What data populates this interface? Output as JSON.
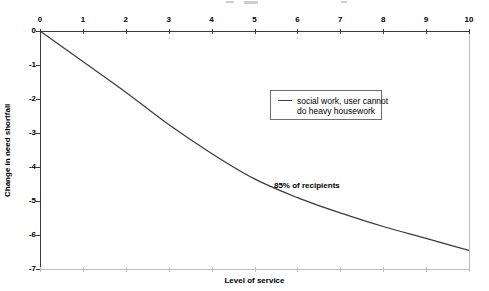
{
  "chart_data": {
    "type": "line",
    "title": "",
    "xlabel": "Level of service",
    "ylabel": "Change in need shortfall",
    "x": [
      0,
      1,
      2,
      3,
      4,
      5,
      6,
      7,
      8,
      9,
      10
    ],
    "x_tick_labels": [
      "0",
      "1",
      "2",
      "3",
      "4",
      "5",
      "6",
      "7",
      "8",
      "9",
      "10"
    ],
    "y_tick_labels": [
      "0",
      "-1",
      "-2",
      "-3",
      "-4",
      "-5",
      "-6",
      "-7"
    ],
    "xlim": [
      0,
      10
    ],
    "ylim": [
      -7,
      0
    ],
    "grid": false,
    "legend_position": "inside-top-right",
    "series": [
      {
        "name": "social work, user cannot do heavy housework",
        "values": [
          0,
          -0.9,
          -1.8,
          -2.75,
          -3.6,
          -4.35,
          -4.9,
          -5.35,
          -5.75,
          -6.1,
          -6.45
        ]
      }
    ],
    "annotations": [
      {
        "text": "85% of recipients",
        "x": 5.5,
        "y": -4.5
      }
    ]
  },
  "legend": {
    "lines": [
      "social work, user cannot",
      "do heavy housework"
    ]
  },
  "colors": {
    "line": "#3a3a3a",
    "axis": "#3a3a3a",
    "plot_border": "#bdbdbd",
    "background": "#ffffff",
    "text": "#000000"
  }
}
